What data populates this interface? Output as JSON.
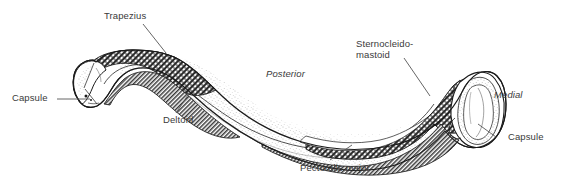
{
  "figure": {
    "kind": "anatomical-illustration",
    "view_note": "Posterior",
    "background_color": "#ffffff",
    "ink_color": "#1a1a1a",
    "label_color": "#3a3a3a",
    "leader_color": "#555555"
  },
  "labels": {
    "trapezius": "Trapezius",
    "capsule_left": "Capsule",
    "deltoid": "Deltoid",
    "posterior": "Posterior",
    "sternocleidomastoid_line1": "Sternocleido-",
    "sternocleidomastoid_line2": "mastoid",
    "medial": "Medial",
    "capsule_right": "Capsule",
    "pectoralis_major": "Pectoralis major"
  }
}
